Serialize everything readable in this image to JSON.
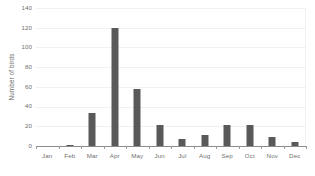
{
  "chart_data": {
    "type": "bar",
    "title": "",
    "xlabel": "",
    "ylabel": "Number of birds",
    "categories": [
      "Jan",
      "Feb",
      "Mar",
      "Apr",
      "May",
      "Jun",
      "Jul",
      "Aug",
      "Sep",
      "Oct",
      "Nov",
      "Dec"
    ],
    "values": [
      0,
      1,
      34,
      120,
      58,
      21,
      7,
      11,
      21,
      21,
      9,
      4
    ],
    "ylim": [
      0,
      140
    ],
    "yticks": [
      0,
      20,
      40,
      60,
      80,
      100,
      120,
      140
    ],
    "ytick_labels": [
      "0",
      "20",
      "40",
      "60",
      "80",
      "100",
      "120",
      "140"
    ],
    "grid": true,
    "legend": false,
    "series": [
      {
        "name": "Number of birds",
        "color": "#595959",
        "values": [
          0,
          1,
          34,
          120,
          58,
          21,
          7,
          11,
          21,
          21,
          9,
          4
        ]
      }
    ]
  },
  "colors": {
    "bar": "#595959",
    "gridline": "#f0f0f0",
    "axis": "#8c8c8c",
    "text": "#6f6f6f",
    "background": "#ffffff"
  }
}
